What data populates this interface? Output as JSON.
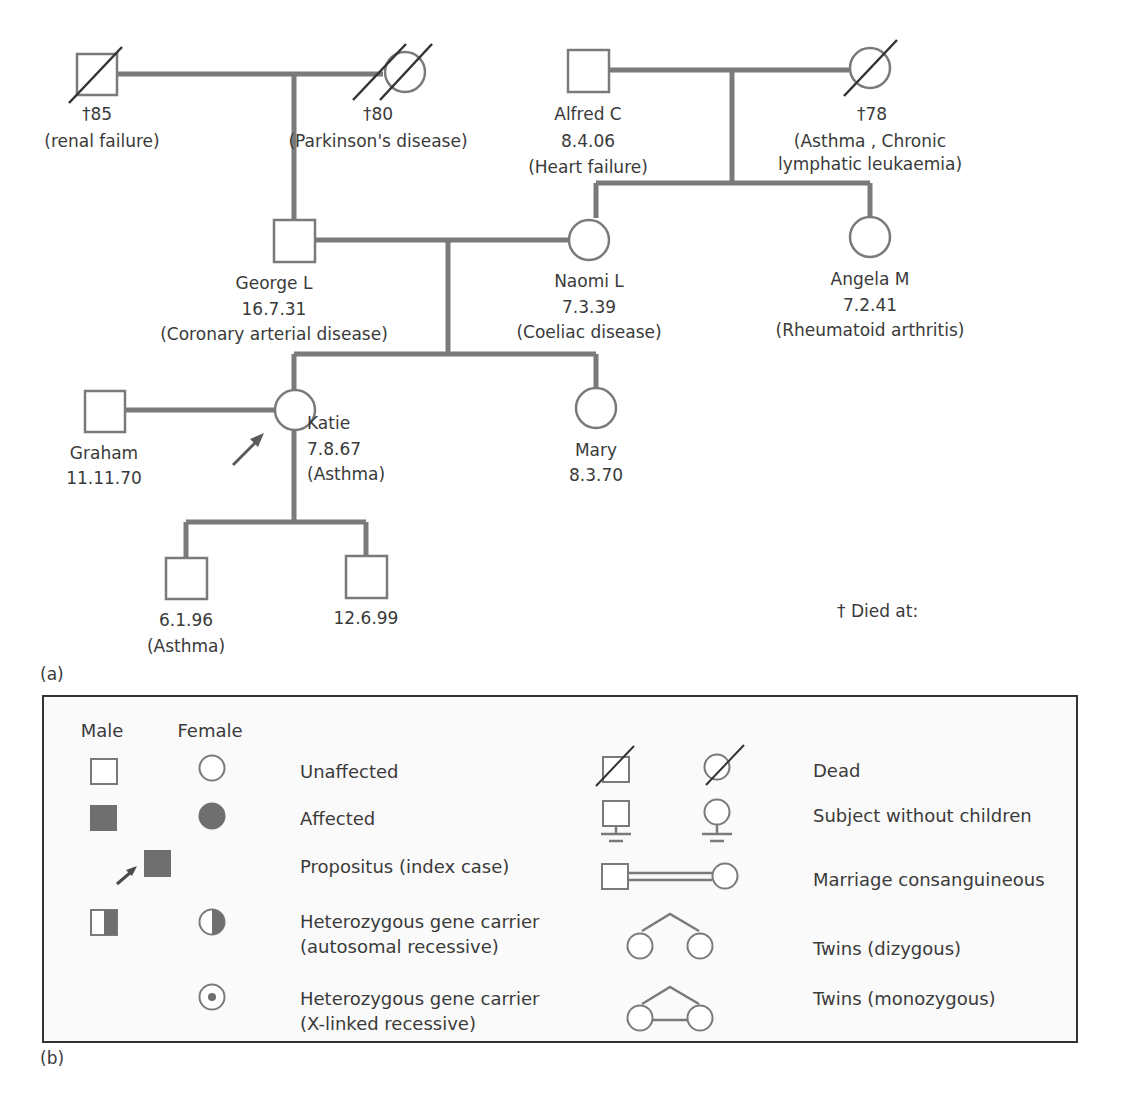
{
  "pedigree": {
    "panel_label": "(a)",
    "footnote": "† Died at:",
    "individuals": [
      {
        "id": "gf_paternal",
        "sex": "male",
        "status": "dead",
        "lines": [
          "†85",
          "(renal failure)"
        ]
      },
      {
        "id": "gm_paternal",
        "sex": "female",
        "status": "dead",
        "lines": [
          "†80",
          "(Parkinson's disease)"
        ]
      },
      {
        "id": "gf_maternal",
        "sex": "male",
        "status": "alive",
        "lines": [
          "Alfred C",
          "8.4.06",
          "(Heart failure)"
        ]
      },
      {
        "id": "gm_maternal",
        "sex": "female",
        "status": "dead",
        "lines": [
          "†78",
          "(Asthma , Chronic",
          "lymphatic leukaemia)"
        ]
      },
      {
        "id": "george",
        "sex": "male",
        "status": "alive",
        "lines": [
          "George L",
          "16.7.31",
          "(Coronary arterial disease)"
        ]
      },
      {
        "id": "naomi",
        "sex": "female",
        "status": "alive",
        "lines": [
          "Naomi L",
          "7.3.39",
          "(Coeliac disease)"
        ]
      },
      {
        "id": "angela",
        "sex": "female",
        "status": "alive",
        "lines": [
          "Angela M",
          "7.2.41",
          "(Rheumatoid arthritis)"
        ]
      },
      {
        "id": "graham",
        "sex": "male",
        "status": "alive",
        "lines": [
          "Graham",
          "11.11.70"
        ]
      },
      {
        "id": "katie",
        "sex": "female",
        "status": "alive",
        "propositus": true,
        "lines": [
          "Katie",
          "7.8.67",
          "(Asthma)"
        ]
      },
      {
        "id": "mary",
        "sex": "female",
        "status": "alive",
        "lines": [
          "Mary",
          "8.3.70"
        ]
      },
      {
        "id": "son1",
        "sex": "male",
        "status": "alive",
        "lines": [
          "6.1.96",
          "(Asthma)"
        ]
      },
      {
        "id": "son2",
        "sex": "male",
        "status": "alive",
        "lines": [
          "12.6.99"
        ]
      }
    ]
  },
  "legend": {
    "panel_label": "(b)",
    "headers": {
      "male": "Male",
      "female": "Female"
    },
    "left_items": [
      {
        "symbol": "unaffected",
        "label": [
          "Unaffected"
        ]
      },
      {
        "symbol": "affected",
        "label": [
          "Affected"
        ]
      },
      {
        "symbol": "propositus",
        "label": [
          "Propositus (index case)"
        ]
      },
      {
        "symbol": "carrier-autosomal",
        "label": [
          "Heterozygous gene carrier",
          "(autosomal recessive)"
        ]
      },
      {
        "symbol": "carrier-x-linked",
        "label": [
          "Heterozygous gene carrier",
          "(X-linked recessive)"
        ]
      }
    ],
    "right_items": [
      {
        "symbol": "dead",
        "label": [
          "Dead"
        ]
      },
      {
        "symbol": "no-children",
        "label": [
          "Subject without children"
        ]
      },
      {
        "symbol": "consanguineous",
        "label": [
          "Marriage consanguineous"
        ]
      },
      {
        "symbol": "twins-dizygous",
        "label": [
          "Twins (dizygous)"
        ]
      },
      {
        "symbol": "twins-monozygous",
        "label": [
          "Twins (monozygous)"
        ]
      }
    ]
  },
  "colors": {
    "line": "#7a7a7a",
    "fill": "#6f6f6f",
    "text": "#3a3a3a",
    "legend_bg": "#fafafa",
    "border": "#333333"
  }
}
